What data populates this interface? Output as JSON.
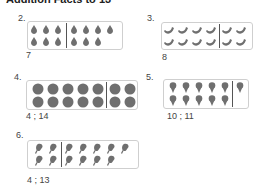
{
  "header": {
    "title": "Addition Facts to 13"
  },
  "problems": [
    {
      "number": "2.",
      "object": "pear",
      "top_count": 7,
      "bottom_count": 6,
      "divider_after": 3,
      "answer": "7"
    },
    {
      "number": "3.",
      "object": "banana",
      "top_count": 6,
      "bottom_count": 6,
      "divider_after": 4,
      "answer": "8"
    },
    {
      "number": "4.",
      "object": "ball",
      "top_count": 7,
      "bottom_count": 7,
      "divider_after": 5,
      "answer": "4 ; 14"
    },
    {
      "number": "5.",
      "object": "ice-cream-cone",
      "top_count": 6,
      "bottom_count": 5,
      "divider_after": 5,
      "answer": "10 ; 11"
    },
    {
      "number": "6.",
      "object": "popsicle",
      "top_count": 7,
      "bottom_count": 6,
      "divider_after": 2,
      "answer": "4 ; 13"
    }
  ],
  "colors": {
    "icon": "#6f6f6f",
    "frame_border": "#cfcfcf",
    "divider": "#555555"
  }
}
